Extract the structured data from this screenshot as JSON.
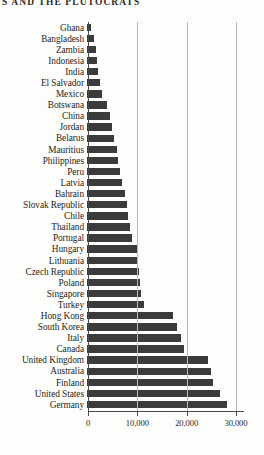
{
  "header": {
    "running_head": "S AND THE PLUTOCRATS"
  },
  "chart_data": {
    "type": "bar",
    "orientation": "horizontal",
    "title": "",
    "xlabel": "",
    "ylabel": "",
    "xlim": [
      0,
      30000
    ],
    "grid": true,
    "legend": false,
    "xticks": [
      0,
      10000,
      20000,
      30000
    ],
    "xtick_labels": [
      "0",
      "10,000",
      "20,000",
      "30,000"
    ],
    "bar_color": "#3b3b3b",
    "gridline_color": "#b9b9b9",
    "axis_color": "#4a4a4a",
    "categories": [
      "Ghana",
      "Bangladesh",
      "Zambia",
      "Indonesia",
      "India",
      "El Salvador",
      "Mexico",
      "Botswana",
      "China",
      "Jordan",
      "Belarus",
      "Mauritius",
      "Philippines",
      "Peru",
      "Latvia",
      "Bahrain",
      "Slovak Republic",
      "Chile",
      "Thailand",
      "Portugal",
      "Hungary",
      "Lithuania",
      "Czech Republic",
      "Poland",
      "Singapore",
      "Turkey",
      "Hong Kong",
      "South Korea",
      "Italy",
      "Canada",
      "United Kingdom",
      "Australia",
      "Finland",
      "United States",
      "Germany"
    ],
    "values": [
      900,
      1500,
      1800,
      2100,
      2300,
      2600,
      3000,
      4100,
      4600,
      5000,
      5500,
      6000,
      6300,
      6700,
      7100,
      7800,
      8100,
      8400,
      8800,
      9200,
      10200,
      10400,
      10600,
      10800,
      11000,
      11600,
      17400,
      18200,
      19100,
      19600,
      24600,
      25200,
      25600,
      26900,
      28400
    ]
  }
}
